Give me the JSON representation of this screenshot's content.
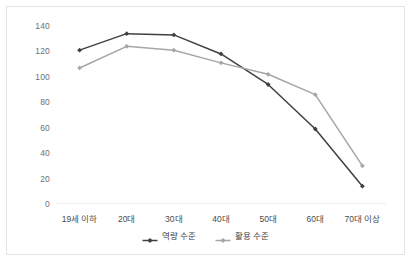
{
  "chart_data": {
    "type": "line",
    "title": "",
    "xlabel": "",
    "ylabel": "",
    "categories": [
      "19세 이하",
      "20대",
      "30대",
      "40대",
      "50대",
      "60대",
      "70대 이상"
    ],
    "series": [
      {
        "name": "역량 수준",
        "color": "#404040",
        "marker": "diamond",
        "values": [
          121,
          134,
          133,
          118,
          94,
          59,
          14
        ]
      },
      {
        "name": "활용 수준",
        "color": "#a6a6a6",
        "marker": "diamond",
        "values": [
          107,
          124,
          121,
          111,
          102,
          86,
          30
        ]
      }
    ],
    "ylim": [
      0,
      140
    ],
    "yticks": [
      0,
      20,
      40,
      60,
      80,
      100,
      120,
      140
    ],
    "ytick_labels": [
      "0",
      "20",
      "40",
      "60",
      "80",
      "100",
      "120",
      "140"
    ],
    "grid": false,
    "legend_position": "bottom",
    "axis_line_color": "#efefef",
    "border_color": "#e2e2e2",
    "background_color": "#ffffff"
  }
}
